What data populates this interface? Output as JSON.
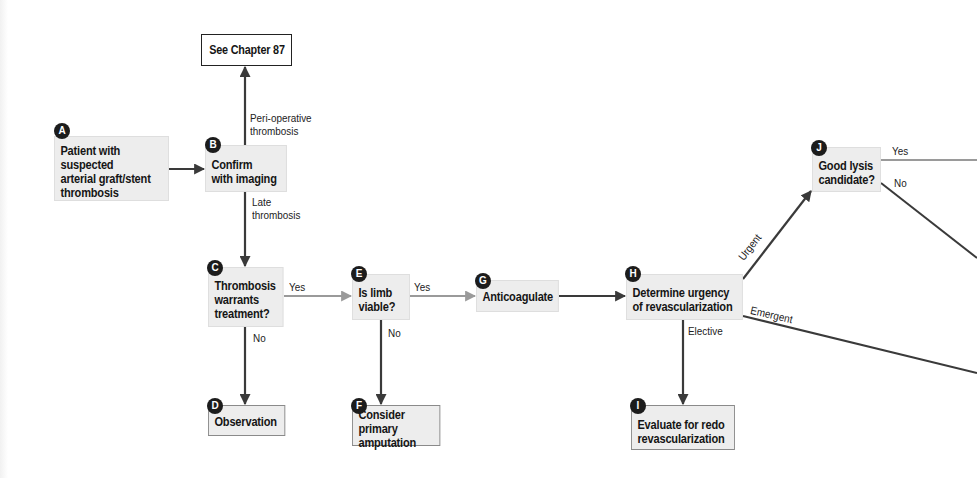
{
  "diagram": {
    "type": "clinical-algorithm-flowchart",
    "colors": {
      "node_fill": "#ededed",
      "dark_edge": "#3a3a3a",
      "light_edge": "#9a9a9a",
      "badge": "#1c1c1c"
    },
    "nodes": {
      "ref": {
        "text": "See Chapter 87"
      },
      "A": {
        "badge": "A",
        "text": "Patient with suspected\narterial graft/stent\nthrombosis"
      },
      "B": {
        "badge": "B",
        "text": "Confirm\nwith imaging"
      },
      "C": {
        "badge": "C",
        "text": "Thrombosis\nwarrants\ntreatment?"
      },
      "D": {
        "badge": "D",
        "text": "Observation"
      },
      "E": {
        "badge": "E",
        "text": "Is limb\nviable?"
      },
      "F": {
        "badge": "F",
        "text": "Consider primary\namputation"
      },
      "G": {
        "badge": "G",
        "text": "Anticoagulate"
      },
      "H": {
        "badge": "H",
        "text": "Determine urgency\nof revascularization"
      },
      "I": {
        "badge": "I",
        "text": "Evaluate for redo\nrevascularization"
      },
      "J": {
        "badge": "J",
        "text": "Good lysis\ncandidate?"
      }
    },
    "edge_labels": {
      "b_up": "Peri-operative\nthrombosis",
      "b_down": "Late\nthrombosis",
      "c_yes": "Yes",
      "c_no": "No",
      "e_yes": "Yes",
      "e_no": "No",
      "h_elective": "Elective",
      "h_urgent": "Urgent",
      "h_emergent": "Emergent",
      "j_yes": "Yes",
      "j_no": "No"
    }
  }
}
